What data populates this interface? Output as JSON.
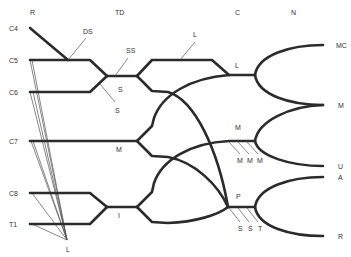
{
  "colors": {
    "line": "#2b2b2b",
    "thin_line": "#555555",
    "text": "#333333",
    "background": "#ffffff"
  },
  "headers": {
    "roots": "R",
    "trunks_divisions": "TD",
    "cords": "C",
    "nerves": "N"
  },
  "roots": {
    "c4": "C4",
    "c5": "C5",
    "c6": "C6",
    "c7": "C7",
    "c8": "C8",
    "t1": "T1"
  },
  "branch_labels": {
    "dorsal_scapular": "DS",
    "suprascapular": "SS",
    "subclavius_upper": "S",
    "subclavius_lower": "S",
    "long_thoracic": "L",
    "lateral_pectoral": "L",
    "lateral_cord": "L",
    "middle_trunk": "M",
    "medial_cord": "M",
    "medial_branches": [
      "M",
      "M",
      "M"
    ],
    "inferior_trunk": "I",
    "posterior_cord": "P",
    "posterior_branches": [
      "S",
      "S",
      "T"
    ]
  },
  "terminal_nerves": {
    "musculocutaneous": "MC",
    "median": "M",
    "ulnar": "U",
    "axillary": "A",
    "radial": "R"
  }
}
